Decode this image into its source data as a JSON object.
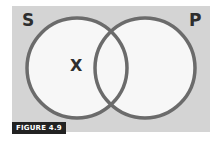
{
  "diagram": {
    "type": "venn",
    "sets": [
      {
        "name": "S",
        "position": "left"
      },
      {
        "name": "P",
        "position": "right"
      }
    ],
    "marks": [
      {
        "symbol": "X",
        "region": "S only"
      }
    ],
    "caption": "FIGURE 4.9",
    "colors": {
      "background": "#d4d4d4",
      "circle_fill": "#f7f7f7",
      "circle_stroke": "#6b6b6b",
      "text": "#2e2e2e",
      "caption_bg": "#222222"
    }
  }
}
